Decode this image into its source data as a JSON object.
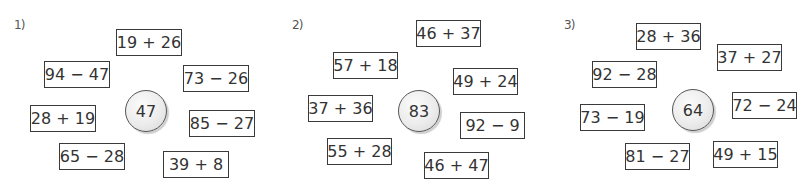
{
  "panels": [
    {
      "label": "1)",
      "target": "47",
      "expressions": [
        "19 + 26",
        "94 − 47",
        "73 − 26",
        "28 + 19",
        "85 − 27",
        "65 − 28",
        "39 + 8"
      ]
    },
    {
      "label": "2)",
      "target": "83",
      "expressions": [
        "46 + 37",
        "57 + 18",
        "49 + 24",
        "37 + 36",
        "92 − 9",
        "55 + 28",
        "46 + 47"
      ]
    },
    {
      "label": "3)",
      "target": "64",
      "expressions": [
        "28 + 36",
        "37 + 27",
        "92 − 28",
        "73 − 19",
        "72 − 24",
        "81 − 27",
        "49 + 15"
      ]
    }
  ]
}
